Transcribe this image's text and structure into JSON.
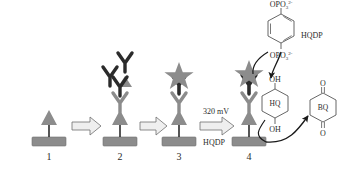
{
  "figure": {
    "type": "schematic-diagram",
    "background": "#ffffff"
  },
  "colors": {
    "electrode": "#8c8c8c",
    "electrode_stroke": "#6e6e6e",
    "antigen_gray": "#8c8c8c",
    "antibody_gray": "#8c8c8c",
    "antibody_dark": "#2b2b2b",
    "star_gray": "#8c8c8c",
    "arrow_fill": "#efefef",
    "arrow_stroke": "#6e6e6e",
    "text": "#2b2b2b",
    "ring_stroke": "#555555",
    "curve_stroke": "#1a1a1a"
  },
  "steps": [
    {
      "id": "step-1",
      "label": "1",
      "x": 48,
      "description": "electrode with captured antigen"
    },
    {
      "id": "step-2",
      "label": "2",
      "x": 108,
      "description": "antigen bound by primary antibody"
    },
    {
      "id": "step-3",
      "label": "3",
      "x": 178,
      "description": "secondary labeled antibody sandwich"
    },
    {
      "id": "step-4",
      "label": "4",
      "x": 248,
      "description": "enzymatic conversion of substrate"
    }
  ],
  "arrows": [
    {
      "id": "arrow-1-2",
      "top_label": "",
      "bottom_label": ""
    },
    {
      "id": "arrow-2-3",
      "top_label": "",
      "bottom_label": ""
    },
    {
      "id": "arrow-3-4",
      "top_label": "320 mV",
      "bottom_label": "HQDP"
    }
  ],
  "molecules": {
    "hqdp": {
      "name": "HQDP",
      "label": "HQDP",
      "top_group_text": "OPO",
      "top_group_sup": "2-",
      "top_group_sub": "3",
      "bottom_group_text": "OPO",
      "bottom_group_sup": "2-",
      "bottom_group_sub": "3"
    },
    "hq": {
      "name": "HQ",
      "ring_label": "HQ",
      "top_group": "OH",
      "bottom_group": "OH"
    },
    "bq": {
      "name": "BQ",
      "ring_label": "BQ",
      "top_group": "O",
      "bottom_group": "O"
    }
  },
  "annotations": {
    "potential": "320 mV",
    "substrate": "HQDP",
    "product_reduced": "HQ",
    "product_oxidized": "BQ"
  }
}
